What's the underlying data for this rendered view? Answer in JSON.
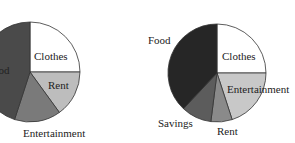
{
  "chart_data": [
    {
      "type": "pie",
      "title": "",
      "categories": [
        "Clothes",
        "Rent",
        "Entertainment",
        "Food"
      ],
      "values": [
        25,
        15,
        15,
        45
      ],
      "colors": [
        "#ffffff",
        "#bdbdbd",
        "#7a7a7a",
        "#4a4a4a"
      ],
      "start_angle": "12 o'clock, clockwise",
      "legend": "none (direct labels)"
    },
    {
      "type": "pie",
      "title": "",
      "categories": [
        "Clothes",
        "Entertainment",
        "Rent",
        "Savings",
        "Food"
      ],
      "values": [
        25,
        20,
        7,
        10,
        38
      ],
      "colors": [
        "#ffffff",
        "#c8c8c8",
        "#8a8a8a",
        "#5c5c5c",
        "#262626"
      ],
      "start_angle": "12 o'clock, clockwise",
      "legend": "none (direct labels)"
    }
  ],
  "labels": {
    "left": {
      "clothes": "Clothes",
      "rent": "Rent",
      "entertainment": "Entertainment",
      "food": "Food"
    },
    "right": {
      "clothes": "Clothes",
      "entertainment": "Entertainment",
      "rent": "Rent",
      "savings": "Savings",
      "food": "Food"
    }
  }
}
